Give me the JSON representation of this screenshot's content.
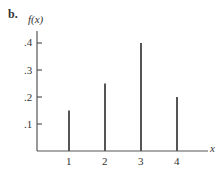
{
  "panel_label": "b.",
  "chart_data": {
    "type": "bar",
    "title": "",
    "xlabel": "x",
    "ylabel": "f(x)",
    "categories": [
      "1",
      "2",
      "3",
      "4"
    ],
    "values": [
      0.15,
      0.25,
      0.4,
      0.2
    ],
    "yticks": [
      ".1",
      ".2",
      ".3",
      ".4"
    ],
    "ylim": [
      0,
      0.4
    ],
    "grid": false,
    "legend": null,
    "style": "spike"
  }
}
